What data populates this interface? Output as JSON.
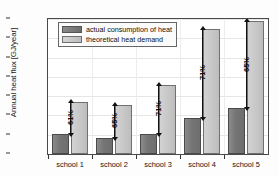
{
  "chart_data": {
    "type": "bar",
    "title": "",
    "xlabel": "",
    "ylabel": "Annual heat flux [GJ/year]",
    "categories": [
      "school 1",
      "school 2",
      "school 3",
      "school 4",
      "school 5"
    ],
    "series": [
      {
        "name": "actual consumption of heat",
        "color": "#757575",
        "values": [
          2100,
          1700,
          2100,
          3750,
          4750
        ]
      },
      {
        "name": "theoretical heat demand",
        "color": "#c8c8c8",
        "values": [
          5400,
          5050,
          7200,
          13000,
          13750
        ]
      }
    ],
    "annotations": [
      "61%",
      "65%",
      "71%",
      "71%",
      "65%"
    ],
    "ylim": [
      0,
      14000
    ],
    "yticks": [
      0,
      2000,
      4000,
      6000,
      8000,
      10000,
      12000,
      14000
    ],
    "ytick_labels": [
      "0",
      "2000",
      "4000",
      "6000",
      "8000",
      "10000",
      "12000",
      "14000"
    ],
    "grid": true,
    "legend_position": "top-left"
  },
  "legend": {
    "entries": [
      {
        "label": "actual consumption of heat"
      },
      {
        "label": "theoretical heat demand"
      }
    ]
  }
}
